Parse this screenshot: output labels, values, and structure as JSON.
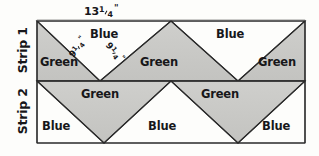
{
  "figure": {
    "kind": "quilt-strip-piecing-diagram",
    "colors": {
      "green_patch_fill": "#c9c9c6",
      "blue_patch_fill": "#fdfdfb",
      "outline": "#2b2b2b",
      "background": "#fdfdfb",
      "text": "#17171a"
    }
  },
  "dimensions": {
    "top_width_label": "13",
    "top_width_fraction_num": "1",
    "top_width_fraction_den": "4",
    "top_width_unit": "\"",
    "diagonal_left_label": "9",
    "diagonal_left_fraction_num": "1",
    "diagonal_left_fraction_den": "4",
    "diagonal_left_unit": "\"",
    "diagonal_right_label": "9",
    "diagonal_right_fraction_num": "1",
    "diagonal_right_fraction_den": "4",
    "diagonal_right_unit": "\""
  },
  "strips": [
    {
      "name": "Strip 1",
      "patches": [
        {
          "color_name": "Green"
        },
        {
          "color_name": "Blue"
        },
        {
          "color_name": "Green"
        },
        {
          "color_name": "Blue"
        },
        {
          "color_name": "Green"
        }
      ]
    },
    {
      "name": "Strip 2",
      "patches": [
        {
          "color_name": "Blue"
        },
        {
          "color_name": "Green"
        },
        {
          "color_name": "Blue"
        },
        {
          "color_name": "Green"
        },
        {
          "color_name": "Blue"
        }
      ]
    }
  ]
}
